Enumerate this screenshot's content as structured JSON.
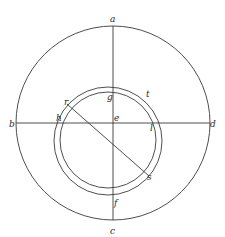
{
  "diagram": {
    "type": "geometric-figure",
    "colors": {
      "stroke": "#3a3a3a",
      "text": "#2a2a2a",
      "background": "#ffffff"
    },
    "labels": {
      "a": "a",
      "b": "b",
      "c": "c",
      "d": "d",
      "e": "e",
      "f": "f",
      "g": "g",
      "h": "h",
      "l": "l",
      "r": "r",
      "s": "s",
      "t": "t"
    },
    "shapes": {
      "outer_circle": {
        "cx": 113,
        "cy": 123,
        "r": 97
      },
      "inner_circle_large": {
        "cx": 108,
        "cy": 141,
        "r": 54
      },
      "inner_circle_small": {
        "cx": 108,
        "cy": 140,
        "r": 48
      },
      "horizontal_diameter": {
        "from": "b",
        "to": "d"
      },
      "vertical_diameter": {
        "from": "a",
        "to": "c"
      },
      "chord": {
        "from": "r",
        "to": "s"
      }
    }
  }
}
